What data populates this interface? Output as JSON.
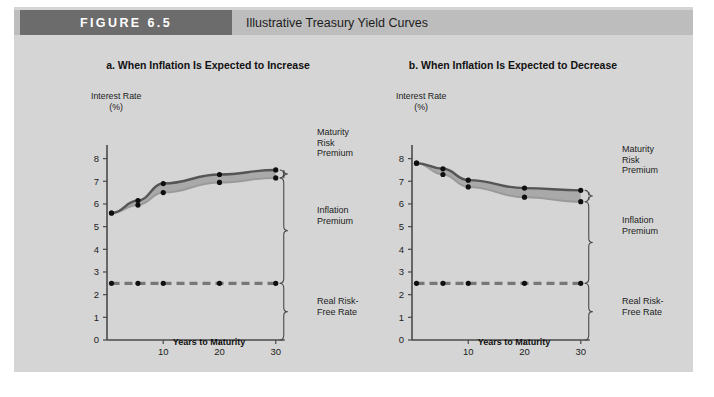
{
  "figure": {
    "tag": "FIGURE 6.5",
    "title": "Illustrative Treasury Yield Curves",
    "tag_bg": "#6c6c6c",
    "header_bg": "#bdbdbd",
    "body_bg": "#d5d5d5"
  },
  "panels": [
    {
      "id": "a",
      "title": "a. When Inflation Is Expected to Increase",
      "y_axis_label": "Interest Rate",
      "y_axis_unit": "(%)",
      "x_axis_title": "Years to Maturity",
      "brackets": [
        {
          "name": "maturity-risk-premium",
          "line1": "Maturity",
          "line2": "Risk",
          "line3": "Premium"
        },
        {
          "name": "inflation-premium",
          "line1": "Inflation",
          "line2": "Premium",
          "line3": ""
        },
        {
          "name": "real-risk-free-rate",
          "line1": "Real Risk-",
          "line2": "Free Rate",
          "line3": ""
        }
      ]
    },
    {
      "id": "b",
      "title": "b. When Inflation Is Expected to Decrease",
      "y_axis_label": "Interest Rate",
      "y_axis_unit": "(%)",
      "x_axis_title": "Years to Maturity",
      "brackets": [
        {
          "name": "maturity-risk-premium",
          "line1": "Maturity",
          "line2": "Risk",
          "line3": "Premium"
        },
        {
          "name": "inflation-premium",
          "line1": "Inflation",
          "line2": "Premium",
          "line3": ""
        },
        {
          "name": "real-risk-free-rate",
          "line1": "Real Risk-",
          "line2": "Free Rate",
          "line3": ""
        }
      ]
    }
  ],
  "chart_data": [
    {
      "type": "line",
      "panel": "a",
      "title": "a. When Inflation Is Expected to Increase",
      "xlabel": "Years to Maturity",
      "ylabel": "Interest Rate (%)",
      "xlim": [
        0,
        32
      ],
      "ylim": [
        0,
        8.6
      ],
      "xticks": [
        10,
        20,
        30
      ],
      "xticklabels": [
        "10",
        "20",
        "30"
      ],
      "yticks": [
        0,
        1,
        2,
        3,
        4,
        5,
        6,
        7,
        8
      ],
      "yticklabels": [
        "0",
        "1",
        "2",
        "3",
        "4",
        "5",
        "6",
        "7",
        "8"
      ],
      "grid": false,
      "legend": "none",
      "series": [
        {
          "name": "Nominal Treasury yield curve (with maturity risk premium)",
          "color": "#555555",
          "style": "solid",
          "x": [
            0.8,
            5.5,
            10,
            20,
            30
          ],
          "y": [
            5.6,
            6.15,
            6.9,
            7.3,
            7.5
          ]
        },
        {
          "name": "Expected inflation + real risk-free rate (no maturity risk premium)",
          "color": "#9a9a9a",
          "style": "solid-light",
          "x": [
            0.8,
            5.5,
            10,
            20,
            30
          ],
          "y": [
            5.6,
            5.95,
            6.5,
            6.95,
            7.15
          ]
        },
        {
          "name": "Real risk-free rate",
          "color": "#777777",
          "style": "dashed",
          "x": [
            0.8,
            5.5,
            10,
            20,
            30
          ],
          "y": [
            2.5,
            2.5,
            2.5,
            2.5,
            2.5
          ]
        }
      ],
      "annotations": [
        {
          "text": "Maturity Risk Premium",
          "at_x": 30,
          "y_from": 7.15,
          "y_to": 7.5
        },
        {
          "text": "Inflation Premium",
          "at_x": 30,
          "y_from": 2.5,
          "y_to": 7.15
        },
        {
          "text": "Real Risk-Free Rate",
          "at_x": 30,
          "y_from": 0,
          "y_to": 2.5
        }
      ]
    },
    {
      "type": "line",
      "panel": "b",
      "title": "b. When Inflation Is Expected to Decrease",
      "xlabel": "Years to Maturity",
      "ylabel": "Interest Rate (%)",
      "xlim": [
        0,
        32
      ],
      "ylim": [
        0,
        8.6
      ],
      "xticks": [
        10,
        20,
        30
      ],
      "xticklabels": [
        "10",
        "20",
        "30"
      ],
      "yticks": [
        0,
        1,
        2,
        3,
        4,
        5,
        6,
        7,
        8
      ],
      "yticklabels": [
        "0",
        "1",
        "2",
        "3",
        "4",
        "5",
        "6",
        "7",
        "8"
      ],
      "grid": false,
      "legend": "none",
      "series": [
        {
          "name": "Nominal Treasury yield curve (with maturity risk premium)",
          "color": "#555555",
          "style": "solid",
          "x": [
            0.8,
            5.5,
            10,
            20,
            30
          ],
          "y": [
            7.8,
            7.55,
            7.05,
            6.7,
            6.6
          ]
        },
        {
          "name": "Expected inflation + real risk-free rate (no maturity risk premium)",
          "color": "#9a9a9a",
          "style": "solid-light",
          "x": [
            0.8,
            5.5,
            10,
            20,
            30
          ],
          "y": [
            7.8,
            7.3,
            6.75,
            6.3,
            6.1
          ]
        },
        {
          "name": "Real risk-free rate",
          "color": "#777777",
          "style": "dashed",
          "x": [
            0.8,
            5.5,
            10,
            20,
            30
          ],
          "y": [
            2.5,
            2.5,
            2.5,
            2.5,
            2.5
          ]
        }
      ],
      "annotations": [
        {
          "text": "Maturity Risk Premium",
          "at_x": 30,
          "y_from": 6.1,
          "y_to": 6.6
        },
        {
          "text": "Inflation Premium",
          "at_x": 30,
          "y_from": 2.5,
          "y_to": 6.1
        },
        {
          "text": "Real Risk-Free Rate",
          "at_x": 30,
          "y_from": 0,
          "y_to": 2.5
        }
      ]
    }
  ]
}
